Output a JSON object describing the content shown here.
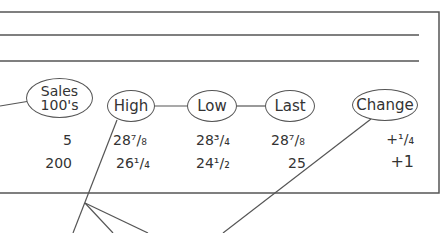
{
  "diagram": {
    "headers": [
      {
        "id": "sales",
        "line1": "Sales",
        "line2": "100's"
      },
      {
        "id": "high",
        "label": "High"
      },
      {
        "id": "low",
        "label": "Low"
      },
      {
        "id": "last",
        "label": "Last"
      },
      {
        "id": "change",
        "label": "Change"
      }
    ],
    "rows": [
      {
        "sales": "5",
        "high": "28⁷/₈",
        "low": "28³/₄",
        "last": "28⁷/₈",
        "change": "+¹/₄"
      },
      {
        "sales": "200",
        "high": "26¹/₄",
        "low": "24¹/₂",
        "last": "25",
        "change": "+1"
      }
    ],
    "colors": {
      "line": "#555555",
      "text": "#333333",
      "background": "#ffffff"
    }
  }
}
